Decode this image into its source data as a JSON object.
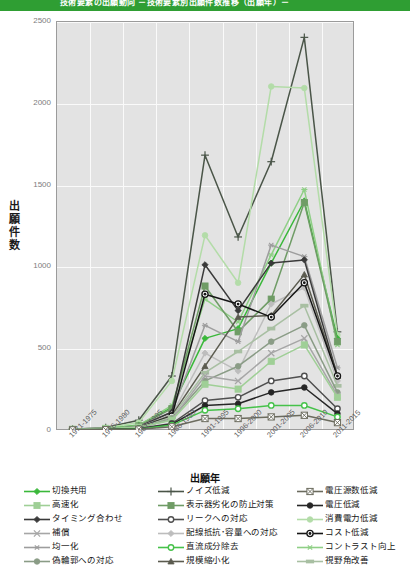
{
  "banner": {
    "title": "技術要素の出願動向  －技術要素別出願件数推移（出願年）－"
  },
  "axes": {
    "y_title": "出願件数",
    "x_title": "出願年",
    "y_ticks": [
      "0",
      "500",
      "1000",
      "1500",
      "2000",
      "2500"
    ],
    "x_ticks": [
      "1971-1975",
      "1976-1980",
      "1981-1985",
      "1986-1990",
      "1991-1995",
      "1996-2000",
      "2001-2005",
      "2006-2010",
      "2011-2015"
    ]
  },
  "chart_data": {
    "type": "line",
    "title": "技術要素の出願動向  －技術要素別出願件数推移（出願年）－",
    "xlabel": "出願年",
    "ylabel": "出願件数",
    "ylim": [
      0,
      2500
    ],
    "grid": true,
    "legend_position": "bottom",
    "categories": [
      "1971-1975",
      "1976-1980",
      "1981-1985",
      "1986-1990",
      "1991-1995",
      "1996-2000",
      "2001-2005",
      "2006-2010",
      "2011-2015"
    ],
    "series": [
      {
        "name": "ノイズ低減",
        "color": "#4a5548",
        "marker": "plus",
        "values": [
          5,
          15,
          60,
          330,
          1680,
          1180,
          1640,
          2400,
          600
        ]
      },
      {
        "name": "消費電力低減",
        "color": "#b3dca8",
        "marker": "circle-pale",
        "values": [
          5,
          12,
          45,
          300,
          1190,
          900,
          2100,
          2090,
          580
        ]
      },
      {
        "name": "切換共用",
        "color": "#3ab83a",
        "marker": "diamond",
        "values": [
          3,
          8,
          30,
          140,
          560,
          620,
          1020,
          1400,
          560
        ]
      },
      {
        "name": "コントラスト向上",
        "color": "#8fcf86",
        "marker": "asterisk-green",
        "values": [
          3,
          8,
          28,
          150,
          800,
          660,
          1070,
          1470,
          520
        ]
      },
      {
        "name": "表示器劣化の防止対策",
        "color": "#6f9c66",
        "marker": "square-green",
        "values": [
          3,
          7,
          25,
          130,
          880,
          600,
          800,
          1390,
          540
        ]
      },
      {
        "name": "均一化",
        "color": "#9d9d9d",
        "marker": "asterisk",
        "values": [
          3,
          7,
          22,
          110,
          640,
          540,
          1130,
          1060,
          380
        ]
      },
      {
        "name": "タイミング合わせ",
        "color": "#3a3a3a",
        "marker": "diamond-dark",
        "values": [
          2,
          6,
          20,
          110,
          1010,
          730,
          1020,
          1040,
          330
        ]
      },
      {
        "name": "配線抵抗･容量への対応",
        "color": "#bdbdbd",
        "marker": "diamond-pale",
        "values": [
          2,
          5,
          18,
          95,
          470,
          360,
          770,
          870,
          300
        ]
      },
      {
        "name": "規模縮小化",
        "color": "#5b5b4f",
        "marker": "triangle",
        "values": [
          2,
          5,
          16,
          90,
          390,
          690,
          700,
          950,
          330
        ]
      },
      {
        "name": "コスト低減",
        "color": "#151515",
        "marker": "bullseye",
        "values": [
          2,
          5,
          15,
          85,
          830,
          770,
          690,
          900,
          330
        ]
      },
      {
        "name": "視野角改善",
        "color": "#a8bfa2",
        "marker": "bar-pale",
        "values": [
          2,
          4,
          14,
          80,
          350,
          480,
          620,
          760,
          270
        ]
      },
      {
        "name": "偽輪郭への対応",
        "color": "#8a9c86",
        "marker": "circle-grgray",
        "values": [
          2,
          4,
          13,
          70,
          300,
          390,
          540,
          640,
          230
        ]
      },
      {
        "name": "補償",
        "color": "#a6a6a6",
        "marker": "x-gray",
        "values": [
          2,
          4,
          12,
          65,
          330,
          300,
          470,
          560,
          210
        ]
      },
      {
        "name": "高速化",
        "color": "#9fcf96",
        "marker": "square-light",
        "values": [
          5,
          10,
          18,
          60,
          280,
          250,
          420,
          520,
          200
        ]
      },
      {
        "name": "リークへの対応",
        "color": "#4f4f4f",
        "marker": "circle-open",
        "values": [
          1,
          3,
          9,
          40,
          180,
          200,
          300,
          330,
          130
        ]
      },
      {
        "name": "電圧低減",
        "color": "#262626",
        "marker": "circle-filled",
        "values": [
          1,
          3,
          8,
          35,
          150,
          160,
          230,
          260,
          100
        ]
      },
      {
        "name": "直流成分除去",
        "color": "#46c24a",
        "marker": "circle-open-gr",
        "values": [
          1,
          2,
          7,
          30,
          120,
          130,
          150,
          150,
          80
        ]
      },
      {
        "name": "電圧源数低減",
        "color": "#6b6b5e",
        "marker": "crossbox",
        "values": [
          1,
          2,
          5,
          20,
          70,
          70,
          80,
          90,
          45
        ]
      }
    ]
  },
  "legend": {
    "columns": [
      {
        "items": [
          {
            "label": "切換共用",
            "marker": "diamond",
            "color": "#3ab83a"
          },
          {
            "label": "高速化",
            "marker": "square-light",
            "color": "#9fcf96"
          },
          {
            "label": "タイミング合わせ",
            "marker": "diamond-dark",
            "color": "#3a3a3a"
          },
          {
            "label": "補償",
            "marker": "x-gray",
            "color": "#a6a6a6"
          },
          {
            "label": "均一化",
            "marker": "asterisk",
            "color": "#9d9d9d"
          },
          {
            "label": "偽輪郭への対応",
            "marker": "circle-grgray",
            "color": "#8a9c86"
          }
        ]
      },
      {
        "items": [
          {
            "label": "ノイズ低減",
            "marker": "plus",
            "color": "#4a5548"
          },
          {
            "label": "表示器劣化の防止対策",
            "marker": "square-green",
            "color": "#6f9c66"
          },
          {
            "label": "リークへの対応",
            "marker": "circle-open",
            "color": "#4f4f4f"
          },
          {
            "label": "配線抵抗･容量への対応",
            "marker": "diamond-pale",
            "color": "#bdbdbd"
          },
          {
            "label": "直流成分除去",
            "marker": "circle-open-gr",
            "color": "#46c24a"
          },
          {
            "label": "規模縮小化",
            "marker": "triangle",
            "color": "#5b5b4f"
          }
        ]
      },
      {
        "items": [
          {
            "label": "電圧源数低減",
            "marker": "crossbox",
            "color": "#6b6b5e"
          },
          {
            "label": "電圧低減",
            "marker": "circle-filled",
            "color": "#262626"
          },
          {
            "label": "消費電力低減",
            "marker": "circle-pale",
            "color": "#b3dca8"
          },
          {
            "label": "コスト低減",
            "marker": "bullseye",
            "color": "#151515"
          },
          {
            "label": "コントラスト向上",
            "marker": "asterisk-green",
            "color": "#8fcf86"
          },
          {
            "label": "視野角改善",
            "marker": "bar-pale",
            "color": "#a8bfa2"
          }
        ]
      }
    ]
  },
  "colors": {
    "banner": "#2f9e33",
    "plot_bg": "#e3e3e3",
    "grid": "#fafafa",
    "accent_green": "#3ab83a"
  }
}
